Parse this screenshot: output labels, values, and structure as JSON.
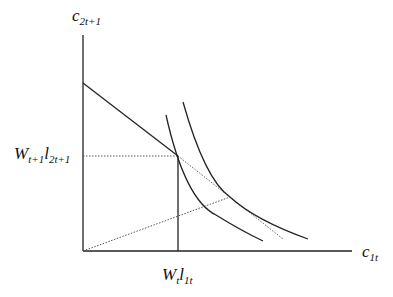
{
  "diagram": {
    "type": "economics-indifference-curve",
    "y_axis_label": {
      "base": "c",
      "sub": "2t+1"
    },
    "x_axis_label": {
      "base": "c",
      "sub": "1t"
    },
    "y_marker_label": {
      "w": "W",
      "w_sub": "t+1",
      "l": "l",
      "l_sub": "2t+1"
    },
    "x_marker_label": {
      "w": "W",
      "w_sub": "t",
      "l": "l",
      "l_sub": "1t"
    },
    "elements": [
      "budget-line (solid, from y-intercept to endowment point)",
      "budget-line-extension (dotted, to tangency)",
      "indifference-curve-low",
      "indifference-curve-high",
      "ray-from-origin (dotted, to tangency)",
      "endowment-guides (dotted horizontal, solid vertical)"
    ],
    "colors": {
      "line": "#222222",
      "dotted": "#555555"
    }
  }
}
